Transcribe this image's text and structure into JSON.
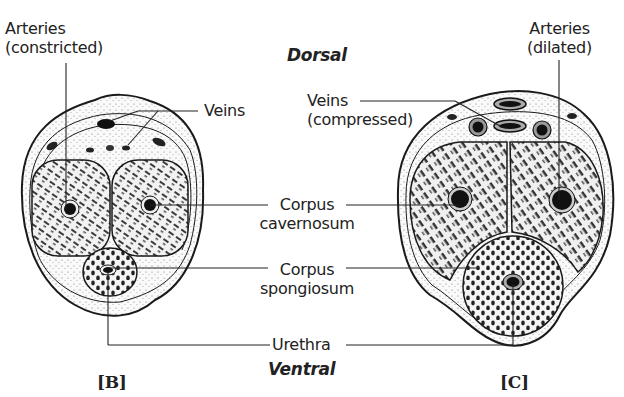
{
  "diagram": {
    "orientation": {
      "top": "Dorsal",
      "bottom": "Ventral"
    },
    "panels": [
      {
        "id": "B",
        "label": "[B]",
        "labels": {
          "arteries_line1": "Arteries",
          "arteries_line2": "(constricted)",
          "veins": "Veins"
        }
      },
      {
        "id": "C",
        "label": "[C]",
        "labels": {
          "arteries_line1": "Arteries",
          "arteries_line2": "(dilated)",
          "veins_line1": "Veins",
          "veins_line2": "(compressed)"
        }
      }
    ],
    "shared_labels": {
      "corpus_cavernosum_line1": "Corpus",
      "corpus_cavernosum_line2": "cavernosum",
      "corpus_spongiosum_line1": "Corpus",
      "corpus_spongiosum_line2": "spongiosum",
      "urethra": "Urethra"
    },
    "colors": {
      "ink": "#1a1a1a",
      "tissue_fill": "#efefef",
      "background": "#ffffff"
    }
  }
}
